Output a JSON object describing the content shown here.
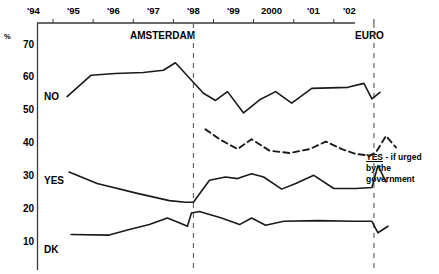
{
  "chart_data": {
    "type": "line",
    "title": "",
    "subtitle": "",
    "xlabel": "",
    "ylabel": "%",
    "ylim": [
      5,
      72
    ],
    "yticks": [
      70,
      60,
      50,
      40,
      30,
      20,
      10
    ],
    "ytick_labels": [
      "70",
      "60",
      "50",
      "40",
      "30",
      "20",
      "10"
    ],
    "xlim": [
      1993.6,
      2002.6
    ],
    "xtick_labels": [
      "'94",
      "'95",
      "'96",
      "'97",
      "'98",
      "'99",
      "2000",
      "'01",
      "'02"
    ],
    "xticks": [
      1994,
      1995,
      1996,
      1997,
      1998,
      1999,
      2000,
      2001,
      2002
    ],
    "grid": false,
    "legend_position": "inline-left",
    "annotations": [
      {
        "text": "AMSTERDAM",
        "x": 1997.5,
        "y": 71
      },
      {
        "text": "EURO",
        "x": 2002.0,
        "y": 71
      },
      {
        "text": "YES - if urged by the government",
        "x": 2002.15,
        "y": 38
      }
    ],
    "vertical_markers": [
      {
        "label": "AMSTERDAM",
        "x": 1997.5
      },
      {
        "label": "EURO",
        "x": 2002.0
      }
    ],
    "series": [
      {
        "name": "NO",
        "style": "solid",
        "label_x": 1994.05,
        "label_y": 54,
        "points": [
          {
            "x": 1994.35,
            "y": 54.0
          },
          {
            "x": 1994.95,
            "y": 60.5
          },
          {
            "x": 1995.55,
            "y": 61.0
          },
          {
            "x": 1996.25,
            "y": 61.3
          },
          {
            "x": 1996.75,
            "y": 62.0
          },
          {
            "x": 1997.05,
            "y": 64.3
          },
          {
            "x": 1997.75,
            "y": 55.0
          },
          {
            "x": 1998.05,
            "y": 52.8
          },
          {
            "x": 1998.35,
            "y": 55.5
          },
          {
            "x": 1998.75,
            "y": 49.0
          },
          {
            "x": 1999.15,
            "y": 53.0
          },
          {
            "x": 1999.55,
            "y": 55.5
          },
          {
            "x": 1999.95,
            "y": 52.0
          },
          {
            "x": 2000.45,
            "y": 56.5
          },
          {
            "x": 2001.35,
            "y": 56.8
          },
          {
            "x": 2001.75,
            "y": 58.0
          },
          {
            "x": 2001.95,
            "y": 53.3
          },
          {
            "x": 2002.15,
            "y": 55.3
          }
        ]
      },
      {
        "name": "YES - if urged by the government",
        "style": "dashed",
        "label_x": 2002.2,
        "label_y": 39,
        "points": [
          {
            "x": 1997.8,
            "y": 44.0
          },
          {
            "x": 1998.15,
            "y": 41.0
          },
          {
            "x": 1998.6,
            "y": 38.0
          },
          {
            "x": 1998.95,
            "y": 41.0
          },
          {
            "x": 1999.4,
            "y": 37.5
          },
          {
            "x": 1999.9,
            "y": 36.8
          },
          {
            "x": 2000.4,
            "y": 38.0
          },
          {
            "x": 2000.8,
            "y": 40.3
          },
          {
            "x": 2001.2,
            "y": 38.0
          },
          {
            "x": 2001.55,
            "y": 36.5
          },
          {
            "x": 2001.9,
            "y": 36.0
          },
          {
            "x": 2002.05,
            "y": 37.0
          },
          {
            "x": 2002.3,
            "y": 42.0
          },
          {
            "x": 2002.55,
            "y": 38.5
          }
        ]
      },
      {
        "name": "YES",
        "style": "solid",
        "label_x": 1994.05,
        "label_y": 31,
        "points": [
          {
            "x": 1994.4,
            "y": 31.0
          },
          {
            "x": 1995.1,
            "y": 27.5
          },
          {
            "x": 1996.1,
            "y": 24.5
          },
          {
            "x": 1996.9,
            "y": 22.3
          },
          {
            "x": 1997.3,
            "y": 21.8
          },
          {
            "x": 1997.5,
            "y": 21.8
          },
          {
            "x": 1997.9,
            "y": 28.5
          },
          {
            "x": 1998.3,
            "y": 29.5
          },
          {
            "x": 1998.6,
            "y": 29.0
          },
          {
            "x": 1998.95,
            "y": 30.5
          },
          {
            "x": 1999.25,
            "y": 29.5
          },
          {
            "x": 1999.7,
            "y": 25.8
          },
          {
            "x": 2000.05,
            "y": 27.5
          },
          {
            "x": 2000.5,
            "y": 30.0
          },
          {
            "x": 2001.0,
            "y": 26.0
          },
          {
            "x": 2001.55,
            "y": 26.0
          },
          {
            "x": 2001.95,
            "y": 26.3
          },
          {
            "x": 2002.1,
            "y": 33.0
          },
          {
            "x": 2002.3,
            "y": 28.0
          }
        ]
      },
      {
        "name": "DK",
        "style": "solid",
        "label_x": 1994.05,
        "label_y": 11.5,
        "points": [
          {
            "x": 1994.45,
            "y": 12.0
          },
          {
            "x": 1995.4,
            "y": 11.8
          },
          {
            "x": 1995.9,
            "y": 13.5
          },
          {
            "x": 1996.4,
            "y": 15.0
          },
          {
            "x": 1996.85,
            "y": 17.0
          },
          {
            "x": 1997.1,
            "y": 15.8
          },
          {
            "x": 1997.35,
            "y": 14.5
          },
          {
            "x": 1997.45,
            "y": 18.5
          },
          {
            "x": 1997.65,
            "y": 19.0
          },
          {
            "x": 1998.2,
            "y": 17.0
          },
          {
            "x": 1998.65,
            "y": 15.0
          },
          {
            "x": 1998.95,
            "y": 17.0
          },
          {
            "x": 1999.3,
            "y": 14.8
          },
          {
            "x": 1999.75,
            "y": 16.0
          },
          {
            "x": 2000.6,
            "y": 16.2
          },
          {
            "x": 2001.5,
            "y": 16.0
          },
          {
            "x": 2001.95,
            "y": 16.0
          },
          {
            "x": 2002.1,
            "y": 12.5
          },
          {
            "x": 2002.35,
            "y": 14.5
          }
        ]
      }
    ]
  },
  "axis": {
    "y_unit": "%",
    "y_tick_0": "70",
    "y_tick_1": "60",
    "y_tick_2": "50",
    "y_tick_3": "40",
    "y_tick_4": "30",
    "y_tick_5": "20",
    "y_tick_6": "10",
    "x_tick_0": "'94",
    "x_tick_1": "'95",
    "x_tick_2": "'96",
    "x_tick_3": "'97",
    "x_tick_4": "'98",
    "x_tick_5": "'99",
    "x_tick_6": "2000",
    "x_tick_7": "'01",
    "x_tick_8": "'02"
  },
  "labels": {
    "no": "NO",
    "yes": "YES",
    "dk": "DK",
    "amsterdam": "AMSTERDAM",
    "euro": "EURO",
    "annot_yes": "YES",
    "annot_line1_rest": " - if urged",
    "annot_line2": "by the",
    "annot_line3": "government"
  },
  "colors": {
    "line": "#1a1a1a",
    "axis": "#333333",
    "marker": "#666666",
    "background": "#ffffff"
  }
}
